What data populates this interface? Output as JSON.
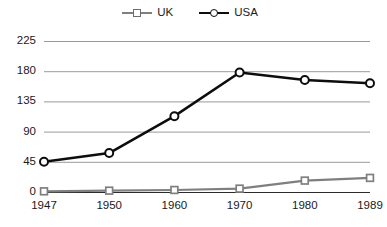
{
  "legend": {
    "position": "top-center",
    "entries": [
      {
        "label": "UK",
        "color": "#7f7f7f",
        "marker": "square"
      },
      {
        "label": "USA",
        "color": "#0d0d0d",
        "marker": "circle"
      }
    ]
  },
  "chart_data": {
    "type": "line",
    "title": "",
    "subtitle": "",
    "xlabel": "",
    "ylabel": "",
    "categories": [
      "1947",
      "1950",
      "1960",
      "1970",
      "1980",
      "1989"
    ],
    "yticks": [
      "0",
      "45",
      "90",
      "135",
      "180",
      "225"
    ],
    "ylim": [
      0,
      225
    ],
    "grid": "horizontal",
    "legend_position": "top-center",
    "series": [
      {
        "name": "UK",
        "color": "#7f7f7f",
        "marker": "square",
        "values": [
          1,
          2,
          3,
          5,
          17,
          21
        ]
      },
      {
        "name": "USA",
        "color": "#0d0d0d",
        "marker": "circle",
        "values": [
          45,
          58,
          113,
          178,
          167,
          162
        ]
      }
    ]
  }
}
